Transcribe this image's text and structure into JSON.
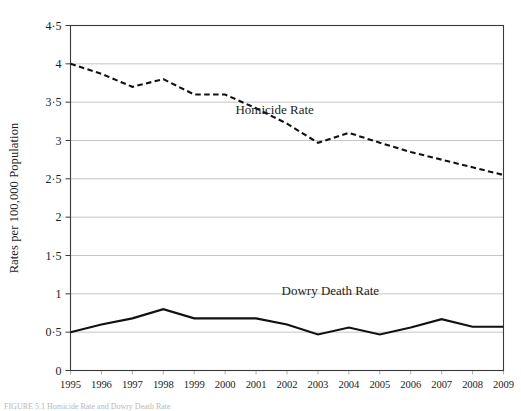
{
  "figure": {
    "caption_partial": "FIGURE 5.1 Homicide Rate and Dowry Death Rate",
    "y_axis_title": "Rates per 100,000 Population"
  },
  "chart_data": {
    "type": "line",
    "title": "",
    "xlabel": "",
    "ylabel": "Rates per 100,000 Population",
    "x": [
      1995,
      1996,
      1997,
      1998,
      1999,
      2000,
      2001,
      2002,
      2003,
      2004,
      2005,
      2006,
      2007,
      2008,
      2009
    ],
    "categories": [
      "1995",
      "1996",
      "1997",
      "1998",
      "1999",
      "2000",
      "2001",
      "2002",
      "2003",
      "2004",
      "2005",
      "2006",
      "2007",
      "2008",
      "2009"
    ],
    "xlim": [
      1995,
      2009
    ],
    "ylim": [
      0,
      4.5
    ],
    "ytick_labels": [
      "0",
      "0·5",
      "1",
      "1·5",
      "2",
      "2·5",
      "3",
      "3·5",
      "4",
      "4·5"
    ],
    "ytick_values": [
      0,
      0.5,
      1,
      1.5,
      2,
      2.5,
      3,
      3.5,
      4,
      4.5
    ],
    "grid": true,
    "grid_axis": "y",
    "legend_position": "inline-annotation",
    "series": [
      {
        "name": "Homicide Rate",
        "style": "dashed",
        "color": "#111111",
        "label_position": {
          "x": 2001.6,
          "y": 3.35
        },
        "values": [
          4.0,
          3.87,
          3.7,
          3.8,
          3.6,
          3.6,
          3.42,
          3.22,
          2.97,
          3.1,
          2.97,
          2.85,
          2.75,
          2.65,
          2.55
        ]
      },
      {
        "name": "Dowry Death Rate",
        "style": "solid",
        "color": "#111111",
        "label_position": {
          "x": 2003.4,
          "y": 0.98
        },
        "values": [
          0.5,
          0.6,
          0.68,
          0.8,
          0.68,
          0.68,
          0.68,
          0.6,
          0.47,
          0.56,
          0.47,
          0.56,
          0.67,
          0.57,
          0.57
        ]
      }
    ]
  },
  "annotations": [
    {
      "name": "homicide-rate-label",
      "text": "Homicide Rate"
    },
    {
      "name": "dowry-death-rate-label",
      "text": "Dowry Death Rate"
    }
  ]
}
